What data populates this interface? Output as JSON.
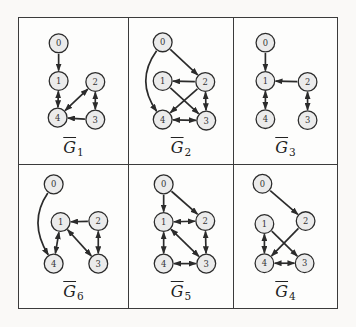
{
  "figure": {
    "type": "graph-grid",
    "description": "Six mixed graphs with directed and bidirected edges, labeled G-bar 1 to 6",
    "colors": {
      "page_bg": "#faf9f7",
      "panel_bg": "#fdfdfc",
      "ink": "#2b2b2b",
      "node_fill": "#ebebeb",
      "node_stroke": "#2b2b2b",
      "grid_border": "#3b3b3b"
    },
    "node_radius": 9.5,
    "edge_width": 1.7,
    "grid": {
      "rows": 2,
      "cols": 3,
      "cell_order": [
        [
          "g1",
          "g2",
          "g3"
        ],
        [
          "g6",
          "g5",
          "g4"
        ]
      ]
    },
    "graphs": {
      "g1": {
        "label": {
          "letter": "G",
          "bar": true,
          "subscript": "1"
        },
        "view_w": 110,
        "nodes": [
          {
            "id": "0",
            "x": 40,
            "y": 25
          },
          {
            "id": "1",
            "x": 40,
            "y": 63
          },
          {
            "id": "2",
            "x": 77,
            "y": 64
          },
          {
            "id": "4",
            "x": 39,
            "y": 100
          },
          {
            "id": "3",
            "x": 77,
            "y": 102
          }
        ],
        "edges": [
          {
            "from": "0",
            "to": "1",
            "kind": "directed"
          },
          {
            "from": "1",
            "to": "4",
            "kind": "bidirected"
          },
          {
            "from": "4",
            "to": "2",
            "kind": "bidirected"
          },
          {
            "from": "2",
            "to": "3",
            "kind": "bidirected"
          },
          {
            "from": "3",
            "to": "4",
            "kind": "directed"
          }
        ]
      },
      "g2": {
        "label": {
          "letter": "G",
          "bar": true,
          "subscript": "2"
        },
        "view_w": 105,
        "nodes": [
          {
            "id": "0",
            "x": 34,
            "y": 24
          },
          {
            "id": "1",
            "x": 34,
            "y": 63
          },
          {
            "id": "2",
            "x": 77,
            "y": 64
          },
          {
            "id": "4",
            "x": 34,
            "y": 102
          },
          {
            "id": "3",
            "x": 78,
            "y": 103
          }
        ],
        "edges": [
          {
            "from": "0",
            "to": "2",
            "kind": "directed"
          },
          {
            "from": "0",
            "to": "4",
            "kind": "directed",
            "control": {
              "x": 6,
              "y": 63
            }
          },
          {
            "from": "2",
            "to": "1",
            "kind": "directed"
          },
          {
            "from": "2",
            "to": "4",
            "kind": "directed"
          },
          {
            "from": "1",
            "to": "3",
            "kind": "directed"
          },
          {
            "from": "2",
            "to": "3",
            "kind": "bidirected"
          },
          {
            "from": "4",
            "to": "3",
            "kind": "bidirected"
          }
        ]
      },
      "g3": {
        "label": {
          "letter": "G",
          "bar": true,
          "subscript": "3"
        },
        "view_w": 105,
        "nodes": [
          {
            "id": "0",
            "x": 32,
            "y": 24
          },
          {
            "id": "1",
            "x": 32,
            "y": 63
          },
          {
            "id": "2",
            "x": 75,
            "y": 64
          },
          {
            "id": "4",
            "x": 32,
            "y": 102
          },
          {
            "id": "3",
            "x": 75,
            "y": 103
          }
        ],
        "edges": [
          {
            "from": "0",
            "to": "1",
            "kind": "directed"
          },
          {
            "from": "2",
            "to": "1",
            "kind": "directed"
          },
          {
            "from": "1",
            "to": "4",
            "kind": "bidirected"
          },
          {
            "from": "2",
            "to": "3",
            "kind": "bidirected"
          }
        ]
      },
      "g6": {
        "label": {
          "letter": "G",
          "bar": true,
          "subscript": "6"
        },
        "view_w": 110,
        "nodes": [
          {
            "id": "0",
            "x": 35,
            "y": 19
          },
          {
            "id": "1",
            "x": 42,
            "y": 57
          },
          {
            "id": "2",
            "x": 80,
            "y": 56
          },
          {
            "id": "4",
            "x": 35,
            "y": 99
          },
          {
            "id": "3",
            "x": 80,
            "y": 99
          }
        ],
        "edges": [
          {
            "from": "0",
            "to": "4",
            "kind": "directed",
            "control": {
              "x": 9,
              "y": 57
            }
          },
          {
            "from": "2",
            "to": "1",
            "kind": "directed"
          },
          {
            "from": "1",
            "to": "4",
            "kind": "bidirected"
          },
          {
            "from": "1",
            "to": "3",
            "kind": "bidirected"
          },
          {
            "from": "2",
            "to": "3",
            "kind": "bidirected"
          }
        ]
      },
      "g5": {
        "label": {
          "letter": "G",
          "bar": true,
          "subscript": "5"
        },
        "view_w": 105,
        "nodes": [
          {
            "id": "0",
            "x": 35,
            "y": 19
          },
          {
            "id": "1",
            "x": 35,
            "y": 57
          },
          {
            "id": "2",
            "x": 77,
            "y": 56
          },
          {
            "id": "4",
            "x": 35,
            "y": 99
          },
          {
            "id": "3",
            "x": 78,
            "y": 99
          }
        ],
        "edges": [
          {
            "from": "0",
            "to": "1",
            "kind": "directed"
          },
          {
            "from": "0",
            "to": "2",
            "kind": "directed"
          },
          {
            "from": "1",
            "to": "2",
            "kind": "bidirected"
          },
          {
            "from": "1",
            "to": "4",
            "kind": "bidirected"
          },
          {
            "from": "1",
            "to": "3",
            "kind": "bidirected"
          },
          {
            "from": "2",
            "to": "3",
            "kind": "bidirected"
          },
          {
            "from": "4",
            "to": "3",
            "kind": "bidirected"
          }
        ]
      },
      "g4": {
        "label": {
          "letter": "G",
          "bar": true,
          "subscript": "4"
        },
        "view_w": 105,
        "nodes": [
          {
            "id": "0",
            "x": 29,
            "y": 18
          },
          {
            "id": "1",
            "x": 31,
            "y": 59
          },
          {
            "id": "2",
            "x": 73,
            "y": 56
          },
          {
            "id": "4",
            "x": 31,
            "y": 99
          },
          {
            "id": "3",
            "x": 72,
            "y": 99
          }
        ],
        "edges": [
          {
            "from": "0",
            "to": "2",
            "kind": "directed"
          },
          {
            "from": "2",
            "to": "4",
            "kind": "directed"
          },
          {
            "from": "1",
            "to": "3",
            "kind": "directed"
          },
          {
            "from": "1",
            "to": "4",
            "kind": "bidirected"
          },
          {
            "from": "4",
            "to": "3",
            "kind": "bidirected"
          }
        ]
      }
    }
  }
}
